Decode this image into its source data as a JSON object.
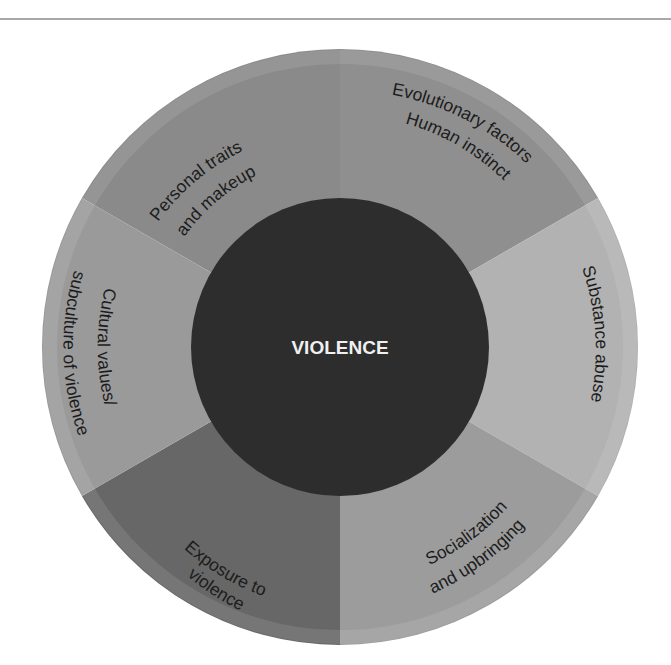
{
  "diagram": {
    "title": "VIOLENCE",
    "center": {
      "label": "VIOLENCE",
      "color": "#2d2d2d"
    },
    "segments": [
      {
        "id": "personal",
        "lines": [
          "Personal traits",
          "and makeup"
        ],
        "color": "#8a8a8a"
      },
      {
        "id": "evolutionary",
        "lines": [
          "Evolutionary factors",
          "Human instinct"
        ],
        "color": "#8f8f8f"
      },
      {
        "id": "substance",
        "lines": [
          "Substance abuse"
        ],
        "color": "#b2b2b2"
      },
      {
        "id": "socialization",
        "lines": [
          "Socialization",
          "and upbringing"
        ],
        "color": "#9c9c9c"
      },
      {
        "id": "exposure",
        "lines": [
          "Exposure to",
          "violence"
        ],
        "color": "#676767"
      },
      {
        "id": "cultural",
        "lines": [
          "Cultural values/",
          "subculture of violence"
        ],
        "color": "#9a9a9a"
      }
    ]
  }
}
